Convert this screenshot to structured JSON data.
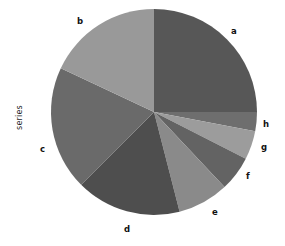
{
  "chart_data": {
    "type": "pie",
    "title": "",
    "ylabel": "series",
    "xlabel": "",
    "legend_position": "none",
    "grid": false,
    "start_angle_deg": 90,
    "direction": "clockwise",
    "categories": [
      "a",
      "b",
      "c",
      "d",
      "e",
      "f",
      "g",
      "h"
    ],
    "values": [
      25.0,
      18.0,
      19.5,
      16.5,
      8.0,
      5.5,
      4.5,
      3.0
    ],
    "units": "percent",
    "slices": [
      {
        "label": "a",
        "value": 25.0,
        "color": "#575757",
        "start_deg": 90.0,
        "end_deg": 0.0
      },
      {
        "label": "h",
        "value": 3.0,
        "color": "#6e6e6e",
        "start_deg": 0.0,
        "end_deg": -10.8
      },
      {
        "label": "g",
        "value": 4.5,
        "color": "#9c9c9c",
        "start_deg": -10.8,
        "end_deg": -27.0
      },
      {
        "label": "f",
        "value": 5.5,
        "color": "#636363",
        "start_deg": -27.0,
        "end_deg": -46.8
      },
      {
        "label": "e",
        "value": 8.0,
        "color": "#8a8a8a",
        "start_deg": -46.8,
        "end_deg": -75.6
      },
      {
        "label": "d",
        "value": 16.5,
        "color": "#4e4e4e",
        "start_deg": -75.6,
        "end_deg": -135.0
      },
      {
        "label": "c",
        "value": 19.5,
        "color": "#6a6a6a",
        "start_deg": -135.0,
        "end_deg": -205.2
      },
      {
        "label": "b",
        "value": 18.0,
        "color": "#999999",
        "start_deg": -205.2,
        "end_deg": -270.0
      }
    ],
    "label_positions": [
      {
        "label": "a",
        "x": 231,
        "y": 27
      },
      {
        "label": "b",
        "x": 77,
        "y": 17
      },
      {
        "label": "c",
        "x": 40,
        "y": 145
      },
      {
        "label": "d",
        "x": 124,
        "y": 225
      },
      {
        "label": "e",
        "x": 212,
        "y": 208
      },
      {
        "label": "f",
        "x": 246,
        "y": 172
      },
      {
        "label": "g",
        "x": 261,
        "y": 143
      },
      {
        "label": "h",
        "x": 263,
        "y": 120
      }
    ],
    "geometry": {
      "cx": 154,
      "cy": 112,
      "r": 103
    },
    "background_color": "#ffffff",
    "text_color": "#111111"
  }
}
